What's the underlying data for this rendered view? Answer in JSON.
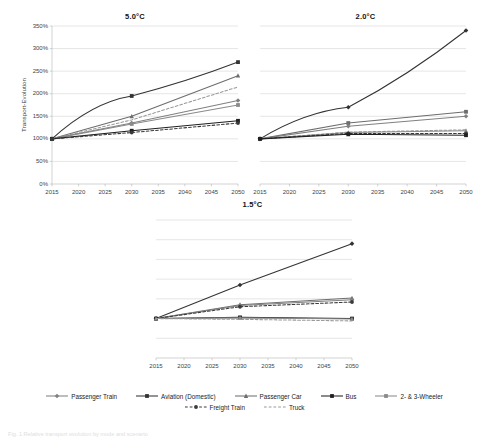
{
  "figure": {
    "caption": "Fig. 1  Relative transport evolution by mode and scenario"
  },
  "axis": {
    "y_title": "Transport-Evolution",
    "y_ticks": [
      "0%",
      "50%",
      "100%",
      "150%",
      "200%",
      "250%",
      "300%",
      "350%"
    ],
    "y_values": [
      0,
      50,
      100,
      150,
      200,
      250,
      300,
      350
    ],
    "x_ticks": [
      "2015",
      "2020",
      "2025",
      "2030",
      "2035",
      "2040",
      "2045",
      "2050"
    ],
    "x_values": [
      2015,
      2020,
      2025,
      2030,
      2035,
      2040,
      2045,
      2050
    ]
  },
  "legend": {
    "row1": [
      {
        "label": "Passenger Train",
        "color": "#808080",
        "dash": "none",
        "marker": "diamond"
      },
      {
        "label": "Aviation (Domestic)",
        "color": "#333333",
        "dash": "none",
        "marker": "square"
      },
      {
        "label": "Passenger Car",
        "color": "#6d6d6d",
        "dash": "none",
        "marker": "triangle"
      },
      {
        "label": "Bus",
        "color": "#1f1f1f",
        "dash": "none",
        "marker": "square"
      },
      {
        "label": "2- & 3-Wheeler",
        "color": "#8a8a8a",
        "dash": "none",
        "marker": "square"
      }
    ],
    "row2": [
      {
        "label": "Freight Train",
        "color": "#3a3a3a",
        "dash": "dash",
        "marker": "circle"
      },
      {
        "label": "Truck",
        "color": "#9a9a9a",
        "dash": "dash",
        "marker": "none"
      }
    ]
  },
  "chart_data": [
    {
      "type": "line",
      "title": "5.0°C",
      "xlabel": "",
      "ylabel": "Transport-Evolution",
      "x": [
        2015,
        2030,
        2050
      ],
      "xlim": [
        2015,
        2050
      ],
      "ylim": [
        0,
        350
      ],
      "grid": true,
      "legend_position": "bottom",
      "series": [
        {
          "name": "Aviation (Domestic)",
          "values": [
            100,
            195,
            270
          ],
          "color": "#333333",
          "dash": "none",
          "marker": "square",
          "curve": true
        },
        {
          "name": "Passenger Car",
          "values": [
            100,
            150,
            240
          ],
          "color": "#6d6d6d",
          "dash": "none",
          "marker": "triangle",
          "curve": false
        },
        {
          "name": "Truck",
          "values": [
            100,
            142,
            215
          ],
          "color": "#9a9a9a",
          "dash": "dash",
          "marker": "none",
          "curve": false
        },
        {
          "name": "Passenger Train",
          "values": [
            100,
            135,
            185
          ],
          "color": "#808080",
          "dash": "none",
          "marker": "diamond",
          "curve": false
        },
        {
          "name": "2- & 3-Wheeler",
          "values": [
            100,
            133,
            175
          ],
          "color": "#8a8a8a",
          "dash": "none",
          "marker": "square",
          "curve": false
        },
        {
          "name": "Bus",
          "values": [
            100,
            118,
            140
          ],
          "color": "#1f1f1f",
          "dash": "none",
          "marker": "square",
          "curve": false
        },
        {
          "name": "Freight Train",
          "values": [
            100,
            114,
            135
          ],
          "color": "#3a3a3a",
          "dash": "dash",
          "marker": "circle",
          "curve": false
        }
      ]
    },
    {
      "type": "line",
      "title": "2.0°C",
      "xlabel": "",
      "ylabel": "",
      "x": [
        2015,
        2030,
        2050
      ],
      "xlim": [
        2015,
        2050
      ],
      "ylim": [
        0,
        350
      ],
      "grid": true,
      "legend_position": "bottom",
      "series": [
        {
          "name": "Aviation (Domestic)",
          "values": [
            100,
            170,
            340
          ],
          "color": "#333333",
          "dash": "none",
          "marker": "diamond",
          "curve": true
        },
        {
          "name": "Passenger Car",
          "values": [
            100,
            135,
            160
          ],
          "color": "#6d6d6d",
          "dash": "none",
          "marker": "square",
          "curve": false
        },
        {
          "name": "Passenger Train",
          "values": [
            100,
            128,
            150
          ],
          "color": "#808080",
          "dash": "none",
          "marker": "diamond",
          "curve": false
        },
        {
          "name": "Truck",
          "values": [
            100,
            115,
            120
          ],
          "color": "#9a9a9a",
          "dash": "dash",
          "marker": "none",
          "curve": false
        },
        {
          "name": "2- & 3-Wheeler",
          "values": [
            100,
            114,
            118
          ],
          "color": "#8a8a8a",
          "dash": "none",
          "marker": "triangle",
          "curve": false
        },
        {
          "name": "Freight Train",
          "values": [
            100,
            112,
            112
          ],
          "color": "#3a3a3a",
          "dash": "dash",
          "marker": "circle",
          "curve": false
        },
        {
          "name": "Bus",
          "values": [
            100,
            110,
            108
          ],
          "color": "#1f1f1f",
          "dash": "none",
          "marker": "square",
          "curve": false
        }
      ]
    },
    {
      "type": "line",
      "title": "1.5°C",
      "xlabel": "",
      "ylabel": "",
      "x": [
        2015,
        2030,
        2050
      ],
      "xlim": [
        2015,
        2050
      ],
      "ylim": [
        0,
        350
      ],
      "grid": true,
      "legend_position": "bottom",
      "series": [
        {
          "name": "Aviation (Domestic)",
          "values": [
            100,
            185,
            290
          ],
          "color": "#333333",
          "dash": "none",
          "marker": "diamond",
          "curve": false
        },
        {
          "name": "Passenger Car",
          "values": [
            100,
            135,
            152
          ],
          "color": "#6d6d6d",
          "dash": "none",
          "marker": "triangle",
          "curve": false
        },
        {
          "name": "Passenger Train",
          "values": [
            100,
            133,
            148
          ],
          "color": "#808080",
          "dash": "none",
          "marker": "diamond",
          "curve": false
        },
        {
          "name": "Freight Train",
          "values": [
            100,
            130,
            142
          ],
          "color": "#3a3a3a",
          "dash": "dash",
          "marker": "circle",
          "curve": false
        },
        {
          "name": "Bus",
          "values": [
            100,
            103,
            100
          ],
          "color": "#1f1f1f",
          "dash": "none",
          "marker": "square",
          "curve": false
        },
        {
          "name": "2- & 3-Wheeler",
          "values": [
            100,
            102,
            99
          ],
          "color": "#8a8a8a",
          "dash": "none",
          "marker": "triangle",
          "curve": false
        },
        {
          "name": "Truck",
          "values": [
            100,
            98,
            94
          ],
          "color": "#9a9a9a",
          "dash": "dash",
          "marker": "none",
          "curve": false
        }
      ]
    }
  ]
}
